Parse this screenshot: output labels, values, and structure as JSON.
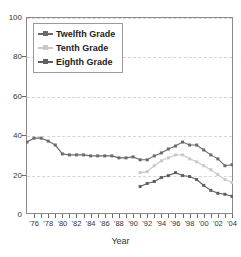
{
  "chart_title": "",
  "axis": {
    "x_title": "Year",
    "y_title": "",
    "y_ticks": [
      0,
      20,
      40,
      60,
      80,
      100
    ],
    "x_tick_labels": [
      "'76",
      "'78",
      "'80",
      "'82",
      "'84",
      "'86",
      "'88",
      "'90",
      "'92",
      "'94",
      "'96",
      "'98",
      "'00",
      "'02",
      "'04"
    ],
    "x_tick_label_years": [
      1976,
      1978,
      1980,
      1982,
      1984,
      1986,
      1988,
      1990,
      1992,
      1994,
      1996,
      1998,
      2000,
      2002,
      2004
    ]
  },
  "colors": {
    "twelfth": "#6b6b6b",
    "tenth": "#c9c9c9",
    "eighth": "#5f5f5f",
    "grid": "#e6cfd4",
    "frame": "#8a8a8a",
    "text": "#333333"
  },
  "legend": {
    "position": "top-left-inside",
    "items": [
      {
        "label": "Twelfth Grade",
        "color": "#6b6b6b",
        "marker": "plus"
      },
      {
        "label": "Tenth Grade",
        "color": "#c9c9c9",
        "marker": "plus"
      },
      {
        "label": "Eighth Grade",
        "color": "#5f5f5f",
        "marker": "triangle"
      }
    ]
  },
  "chart_data": {
    "type": "line",
    "title": "",
    "xlabel": "Year",
    "ylabel": "",
    "xlim": [
      1975,
      2004
    ],
    "ylim": [
      0,
      100
    ],
    "grid": true,
    "legend_position": "upper left",
    "x": [
      1975,
      1976,
      1977,
      1978,
      1979,
      1980,
      1981,
      1982,
      1983,
      1984,
      1985,
      1986,
      1987,
      1988,
      1989,
      1990,
      1991,
      1992,
      1993,
      1994,
      1995,
      1996,
      1997,
      1998,
      1999,
      2000,
      2001,
      2002,
      2003,
      2004
    ],
    "series": [
      {
        "name": "Twelfth Grade",
        "color": "#6b6b6b",
        "values": [
          36.5,
          38.5,
          38.5,
          37.0,
          35.0,
          30.5,
          30.0,
          30.0,
          30.0,
          29.5,
          29.5,
          29.5,
          29.5,
          28.5,
          28.5,
          29.0,
          27.5,
          27.5,
          29.5,
          31.0,
          33.0,
          34.5,
          36.5,
          35.0,
          35.0,
          32.5,
          30.0,
          28.0,
          24.5,
          25.0
        ]
      },
      {
        "name": "Tenth Grade",
        "color": "#c9c9c9",
        "values": [
          null,
          null,
          null,
          null,
          null,
          null,
          null,
          null,
          null,
          null,
          null,
          null,
          null,
          null,
          null,
          null,
          21.0,
          21.5,
          24.5,
          27.0,
          28.5,
          30.0,
          30.0,
          28.0,
          26.5,
          24.5,
          22.5,
          20.0,
          17.5,
          16.0
        ]
      },
      {
        "name": "Eighth Grade",
        "color": "#5f5f5f",
        "values": [
          null,
          null,
          null,
          null,
          null,
          null,
          null,
          null,
          null,
          null,
          null,
          null,
          null,
          null,
          null,
          null,
          14.0,
          15.5,
          16.5,
          18.5,
          19.5,
          21.0,
          19.5,
          19.0,
          17.5,
          14.5,
          12.0,
          10.5,
          10.0,
          9.0
        ]
      }
    ]
  }
}
